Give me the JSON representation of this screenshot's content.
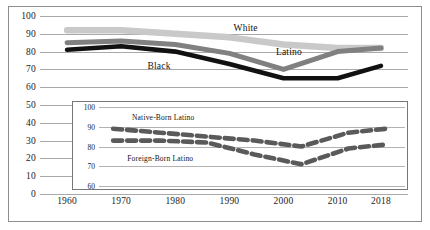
{
  "chart_data": {
    "type": "line",
    "title": "",
    "xlabel": "",
    "ylabel": "",
    "x": [
      1960,
      1970,
      1980,
      1990,
      2000,
      2010,
      2018
    ],
    "categories": [
      "1960",
      "1970",
      "1980",
      "1990",
      "2000",
      "2010",
      "2018"
    ],
    "xlim": [
      1955,
      2023
    ],
    "ylim": [
      0,
      100
    ],
    "yticks": [
      0,
      10,
      20,
      30,
      40,
      50,
      60,
      70,
      80,
      90,
      100
    ],
    "ytick_labels": [
      "0",
      "10",
      "20",
      "30",
      "40",
      "50",
      "60",
      "70",
      "80",
      "90",
      "100"
    ],
    "grid": true,
    "legend": "inline-annotations",
    "series": [
      {
        "name": "White",
        "color": "#c9c9c9",
        "values": [
          92,
          92,
          90,
          88,
          84,
          82,
          82
        ]
      },
      {
        "name": "Latino",
        "color": "#808080",
        "values": [
          85,
          86,
          84,
          79,
          70,
          80,
          82
        ]
      },
      {
        "name": "Black",
        "color": "#111111",
        "values": [
          81,
          83,
          80,
          73,
          65,
          65,
          72
        ]
      }
    ],
    "annotations": [
      {
        "text": "White",
        "x": 1993,
        "y": 93
      },
      {
        "text": "Latino",
        "x": 2001,
        "y": 80
      },
      {
        "text": "Black",
        "x": 1977,
        "y": 72
      }
    ],
    "inset": {
      "type": "line",
      "title": "",
      "x": [
        1960,
        1970,
        1980,
        1990,
        2000,
        2010,
        2018
      ],
      "categories": [
        "1960",
        "1970",
        "1980",
        "1990",
        "2000",
        "2010",
        "2018"
      ],
      "xlim": [
        1957,
        2022
      ],
      "ylim": [
        60,
        100
      ],
      "yticks": [
        60,
        70,
        80,
        90,
        100
      ],
      "ytick_labels": [
        "60",
        "70",
        "80",
        "90",
        "100"
      ],
      "grid": true,
      "linestyle": "dashed",
      "series": [
        {
          "name": "Native-Born Latino",
          "color": "#5a5a5a",
          "values": [
            89,
            87,
            85,
            83,
            80,
            87,
            89
          ]
        },
        {
          "name": "Foreign-Born Latino",
          "color": "#5a5a5a",
          "values": [
            83,
            83,
            82,
            76,
            71,
            79,
            81
          ]
        }
      ],
      "annotations": [
        {
          "text": "Native-Born Latino",
          "x": 1964,
          "y": 95
        },
        {
          "text": "Foreign-Born Latino",
          "x": 1963,
          "y": 74
        }
      ]
    }
  },
  "colors": {
    "white_series": "#c9c9c9",
    "latino_series": "#808080",
    "black_series": "#111111",
    "inset_series": "#5a5a5a",
    "gridline": "#a9a9a9",
    "frame": "#8d8d8d",
    "background": "#ffffff"
  }
}
